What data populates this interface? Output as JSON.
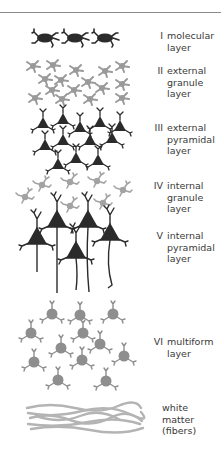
{
  "diagram": {
    "title": "",
    "colors": {
      "dark_cell": "#2b2b2b",
      "gray_cell": "#9a9a9a",
      "fiber": "#b4b4b4",
      "text": "#3a3a3a",
      "rule": "#8a8a8a"
    },
    "layers": [
      {
        "numeral": "I",
        "name": "molecular\nlayer",
        "cell_type": "horizontal cells",
        "shade": "dark"
      },
      {
        "numeral": "II",
        "name": "external\ngranule\nlayer",
        "cell_type": "granule (stellate) cells",
        "shade": "gray"
      },
      {
        "numeral": "III",
        "name": "external\npyramidal\nlayer",
        "cell_type": "small pyramidal cells",
        "shade": "dark"
      },
      {
        "numeral": "IV",
        "name": "internal\ngranule\nlayer",
        "cell_type": "granule cells",
        "shade": "gray"
      },
      {
        "numeral": "V",
        "name": "internal\npyramidal\nlayer",
        "cell_type": "large pyramidal cells",
        "shade": "dark"
      },
      {
        "numeral": "VI",
        "name": "multiform\nlayer",
        "cell_type": "round multiform cells",
        "shade": "gray"
      },
      {
        "numeral": "",
        "name": "white\nmatter\n(fibers)",
        "cell_type": "fibers",
        "shade": "light-gray"
      }
    ]
  }
}
